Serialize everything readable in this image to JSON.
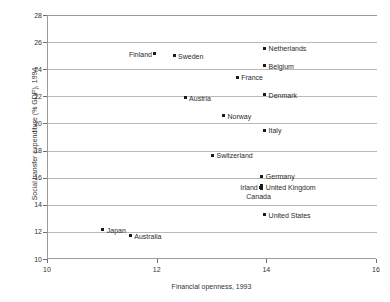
{
  "chart_data": {
    "type": "scatter",
    "title": "",
    "xlabel": "Financial openness, 1993",
    "ylabel": "Social transfer expenditure (% GDP), 1994",
    "xlim": [
      10,
      16
    ],
    "ylim": [
      10,
      28
    ],
    "xticks": [
      "10",
      "12",
      "14",
      "16"
    ],
    "yticks": [
      "10",
      "12",
      "14",
      "16",
      "18",
      "20",
      "22",
      "24",
      "26",
      "28"
    ],
    "grid": true,
    "legend": "none",
    "marker_color": "#1a1a1a",
    "points": [
      {
        "label": "Finland",
        "x": 11.95,
        "y": 25.15,
        "label_side": "left"
      },
      {
        "label": "Sweden",
        "x": 12.3,
        "y": 25.0,
        "label_side": "right"
      },
      {
        "label": "Netherlands",
        "x": 13.95,
        "y": 25.55,
        "label_side": "right"
      },
      {
        "label": "Belgium",
        "x": 13.95,
        "y": 24.25,
        "label_side": "right"
      },
      {
        "label": "France",
        "x": 13.45,
        "y": 23.4,
        "label_side": "right"
      },
      {
        "label": "Austria",
        "x": 12.5,
        "y": 21.9,
        "label_side": "right"
      },
      {
        "label": "Denmark",
        "x": 13.95,
        "y": 22.1,
        "label_side": "right"
      },
      {
        "label": "Norway",
        "x": 13.2,
        "y": 20.55,
        "label_side": "right"
      },
      {
        "label": "Italy",
        "x": 13.95,
        "y": 19.5,
        "label_side": "right"
      },
      {
        "label": "Switzerland",
        "x": 13.0,
        "y": 17.65,
        "label_side": "right"
      },
      {
        "label": "Germany",
        "x": 13.9,
        "y": 16.1,
        "label_side": "right"
      },
      {
        "label": "Irland",
        "x": 13.88,
        "y": 15.3,
        "label_side": "left"
      },
      {
        "label": "United Kingdom",
        "x": 13.9,
        "y": 15.3,
        "label_side": "right"
      },
      {
        "label": "Canada",
        "x": 13.9,
        "y": 14.65,
        "label_side": "cmid"
      },
      {
        "label": "United States",
        "x": 13.95,
        "y": 13.25,
        "label_side": "right"
      },
      {
        "label": "Japan",
        "x": 11.0,
        "y": 12.15,
        "label_side": "right"
      },
      {
        "label": "Australia",
        "x": 11.5,
        "y": 11.7,
        "label_side": "right"
      }
    ]
  }
}
